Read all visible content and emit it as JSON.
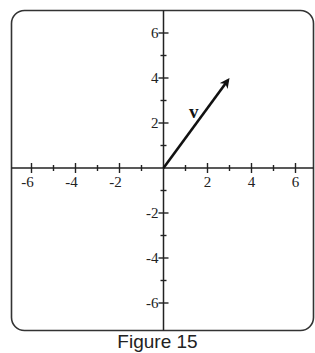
{
  "figure": {
    "caption": "Figure 15",
    "vector_label": "v"
  },
  "chart_data": {
    "type": "vector-plot",
    "title": "",
    "caption": "Figure 15",
    "xlabel": "",
    "ylabel": "",
    "xlim": [
      -7,
      7
    ],
    "ylim": [
      -7,
      7
    ],
    "grid": false,
    "x_tick_labels": [
      "-6",
      "-4",
      "-2",
      "2",
      "4",
      "6"
    ],
    "y_tick_labels": [
      "6",
      "4",
      "2",
      "-2",
      "-4",
      "-6"
    ],
    "x_tick_values": [
      -6,
      -4,
      -2,
      2,
      4,
      6
    ],
    "y_tick_values": [
      6,
      4,
      2,
      -2,
      -4,
      -6
    ],
    "minor_tick_step": 1,
    "vectors": [
      {
        "label": "v",
        "tail": [
          0,
          0
        ],
        "head": [
          3,
          4
        ]
      }
    ],
    "colors": {
      "axes": "#222222",
      "vector": "#111111",
      "frame": "#333333"
    }
  }
}
